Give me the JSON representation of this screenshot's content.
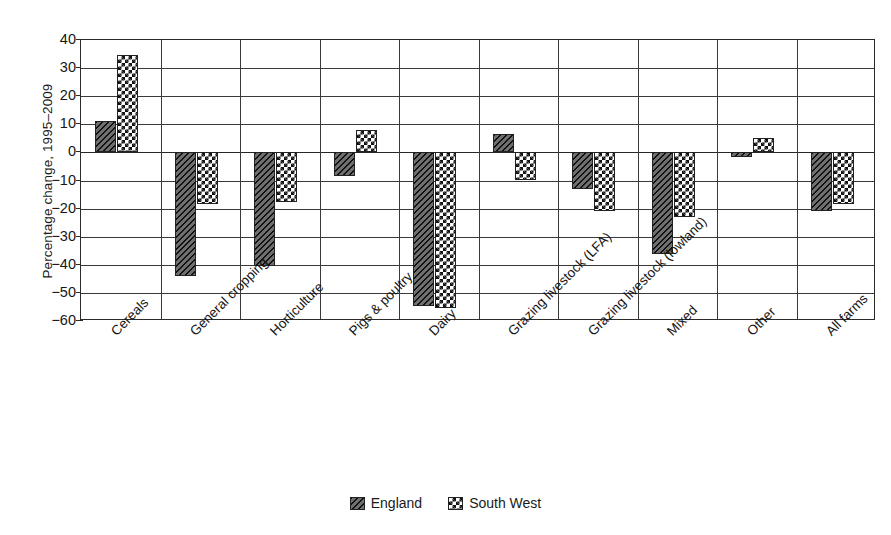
{
  "chart_data": {
    "type": "bar",
    "title": "",
    "xlabel": "",
    "ylabel": "Percentage change, 1995–2009",
    "ylim": [
      -60,
      40
    ],
    "yticks": [
      40,
      30,
      20,
      10,
      0,
      -10,
      -20,
      -30,
      -40,
      -50,
      -60
    ],
    "ytick_labels": [
      "40",
      "30",
      "20",
      "10",
      "0",
      "−10",
      "−20",
      "−30",
      "−40",
      "−50",
      "−60"
    ],
    "grid": true,
    "legend_position": "bottom-center",
    "categories": [
      "Cereals",
      "General cropping",
      "Horticulture",
      "Pigs & poultry",
      "Dairy",
      "Grazing livestock (LFA)",
      "Grazing livestock (lowland)",
      "Mixed",
      "Other",
      "All farms"
    ],
    "series": [
      {
        "name": "England",
        "pattern": "diagonal-hatch",
        "values": [
          11,
          -44,
          -40.5,
          -8.5,
          -54.5,
          6.5,
          -13,
          -36,
          -1.5,
          -21
        ]
      },
      {
        "name": "South West",
        "pattern": "checkerboard",
        "values": [
          34.5,
          -18.5,
          -17.5,
          8,
          -55.5,
          -10,
          -21,
          -23,
          5,
          -18.5
        ]
      }
    ]
  },
  "legend": {
    "items": [
      {
        "label": "England"
      },
      {
        "label": "South West"
      }
    ]
  },
  "colors": {
    "axis": "#2b2b2b",
    "grid": "#3a3a3a",
    "england_fill": "#6f6f6f",
    "southwest_fill": "#ffffff",
    "text": "#141414"
  }
}
